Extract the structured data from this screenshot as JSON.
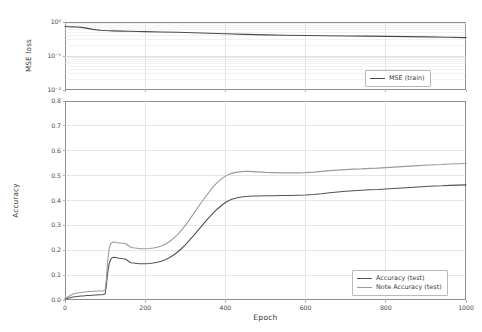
{
  "figure": {
    "background_color": "#ffffff",
    "axis_color": "#8d8d8d",
    "grid_color": "#d6d6d6"
  },
  "chart_data": [
    {
      "type": "line",
      "panel": "top",
      "title": "",
      "xlabel": "",
      "ylabel": "MSE loss",
      "yscale": "log",
      "ylim": [
        0.01,
        1.0
      ],
      "xlim": [
        0,
        1000
      ],
      "grid": true,
      "legend_position": "lower right",
      "ytick_labels": [
        "10⁰",
        "10⁻¹",
        "10⁻²"
      ],
      "ytick_values": [
        1.0,
        0.1,
        0.01
      ],
      "xtick_values": [
        0,
        200,
        400,
        600,
        800,
        1000
      ],
      "series": [
        {
          "name": "MSE (train)",
          "color": "#4a4a4a",
          "linewidth": 1.1,
          "x": [
            0,
            10,
            20,
            30,
            40,
            50,
            60,
            70,
            80,
            90,
            100,
            120,
            140,
            160,
            180,
            200,
            240,
            280,
            320,
            360,
            400,
            450,
            500,
            550,
            600,
            650,
            700,
            750,
            800,
            850,
            900,
            950,
            1000
          ],
          "y": [
            0.735,
            0.728,
            0.72,
            0.71,
            0.695,
            0.672,
            0.64,
            0.608,
            0.585,
            0.57,
            0.56,
            0.548,
            0.54,
            0.534,
            0.528,
            0.522,
            0.51,
            0.497,
            0.483,
            0.468,
            0.452,
            0.432,
            0.417,
            0.408,
            0.401,
            0.395,
            0.389,
            0.384,
            0.379,
            0.372,
            0.364,
            0.356,
            0.348
          ]
        }
      ]
    },
    {
      "type": "line",
      "panel": "bottom",
      "title": "",
      "xlabel": "Epoch",
      "ylabel": "Accuracy",
      "yscale": "linear",
      "ylim": [
        0.0,
        0.8
      ],
      "xlim": [
        0,
        1000
      ],
      "grid": true,
      "legend_position": "lower right",
      "ytick_labels": [
        "0.0",
        "0.1",
        "0.2",
        "0.3",
        "0.4",
        "0.5",
        "0.6",
        "0.7",
        "0.8"
      ],
      "ytick_values": [
        0.0,
        0.1,
        0.2,
        0.3,
        0.4,
        0.5,
        0.6,
        0.7,
        0.8
      ],
      "xtick_values": [
        0,
        200,
        400,
        600,
        800,
        1000
      ],
      "series": [
        {
          "name": "Accuracy (test)",
          "color": "#525252",
          "linewidth": 1.1,
          "x": [
            0,
            5,
            10,
            15,
            20,
            25,
            30,
            35,
            40,
            45,
            50,
            55,
            60,
            65,
            70,
            75,
            80,
            85,
            90,
            95,
            100,
            103,
            106,
            110,
            114,
            118,
            122,
            126,
            130,
            135,
            140,
            145,
            150,
            155,
            160,
            165,
            170,
            175,
            180,
            185,
            190,
            195,
            200,
            210,
            220,
            230,
            240,
            250,
            260,
            270,
            280,
            290,
            300,
            310,
            320,
            330,
            340,
            350,
            360,
            370,
            380,
            390,
            400,
            410,
            420,
            430,
            440,
            450,
            460,
            470,
            480,
            500,
            520,
            540,
            560,
            580,
            600,
            620,
            640,
            660,
            680,
            700,
            720,
            740,
            760,
            780,
            800,
            820,
            840,
            860,
            880,
            900,
            920,
            940,
            960,
            980,
            1000
          ],
          "y": [
            0.004,
            0.006,
            0.008,
            0.01,
            0.012,
            0.013,
            0.014,
            0.015,
            0.016,
            0.016,
            0.017,
            0.018,
            0.018,
            0.019,
            0.019,
            0.02,
            0.02,
            0.021,
            0.021,
            0.022,
            0.024,
            0.055,
            0.105,
            0.145,
            0.163,
            0.17,
            0.172,
            0.171,
            0.17,
            0.168,
            0.167,
            0.166,
            0.165,
            0.16,
            0.154,
            0.15,
            0.149,
            0.148,
            0.147,
            0.146,
            0.146,
            0.146,
            0.146,
            0.147,
            0.149,
            0.152,
            0.156,
            0.162,
            0.17,
            0.18,
            0.192,
            0.206,
            0.222,
            0.24,
            0.258,
            0.277,
            0.296,
            0.315,
            0.333,
            0.35,
            0.366,
            0.38,
            0.392,
            0.401,
            0.407,
            0.411,
            0.414,
            0.416,
            0.417,
            0.418,
            0.418,
            0.419,
            0.419,
            0.42,
            0.42,
            0.421,
            0.422,
            0.424,
            0.427,
            0.431,
            0.434,
            0.437,
            0.439,
            0.441,
            0.443,
            0.444,
            0.446,
            0.448,
            0.45,
            0.452,
            0.454,
            0.456,
            0.458,
            0.459,
            0.461,
            0.462,
            0.463
          ]
        },
        {
          "name": "Note Accuracy (test)",
          "color": "#9a9a9a",
          "linewidth": 1.1,
          "x": [
            0,
            5,
            10,
            15,
            20,
            25,
            30,
            35,
            40,
            45,
            50,
            55,
            60,
            65,
            70,
            75,
            80,
            85,
            90,
            95,
            100,
            103,
            106,
            110,
            114,
            118,
            122,
            126,
            130,
            135,
            140,
            145,
            150,
            155,
            160,
            165,
            170,
            175,
            180,
            185,
            190,
            195,
            200,
            210,
            220,
            230,
            240,
            250,
            260,
            270,
            280,
            290,
            300,
            310,
            320,
            330,
            340,
            350,
            360,
            370,
            380,
            390,
            400,
            410,
            420,
            430,
            440,
            450,
            460,
            470,
            480,
            500,
            520,
            540,
            560,
            580,
            600,
            620,
            640,
            660,
            680,
            700,
            720,
            740,
            760,
            780,
            800,
            820,
            840,
            860,
            880,
            900,
            920,
            940,
            960,
            980,
            1000
          ],
          "y": [
            0.006,
            0.01,
            0.015,
            0.02,
            0.024,
            0.026,
            0.028,
            0.029,
            0.03,
            0.031,
            0.032,
            0.033,
            0.034,
            0.034,
            0.035,
            0.035,
            0.036,
            0.036,
            0.036,
            0.037,
            0.04,
            0.08,
            0.15,
            0.205,
            0.226,
            0.232,
            0.233,
            0.232,
            0.23,
            0.229,
            0.228,
            0.228,
            0.227,
            0.222,
            0.216,
            0.212,
            0.21,
            0.209,
            0.208,
            0.207,
            0.206,
            0.206,
            0.206,
            0.207,
            0.209,
            0.212,
            0.217,
            0.224,
            0.234,
            0.247,
            0.262,
            0.28,
            0.3,
            0.322,
            0.345,
            0.369,
            0.392,
            0.414,
            0.436,
            0.456,
            0.473,
            0.487,
            0.498,
            0.506,
            0.511,
            0.514,
            0.516,
            0.517,
            0.517,
            0.516,
            0.515,
            0.513,
            0.512,
            0.511,
            0.511,
            0.511,
            0.512,
            0.514,
            0.517,
            0.52,
            0.522,
            0.524,
            0.526,
            0.527,
            0.529,
            0.53,
            0.532,
            0.534,
            0.536,
            0.538,
            0.54,
            0.542,
            0.544,
            0.545,
            0.547,
            0.548,
            0.549
          ]
        }
      ]
    }
  ],
  "top_legend": {
    "entries": [
      {
        "label": "MSE (train)",
        "color": "#4a4a4a"
      }
    ]
  },
  "bottom_legend": {
    "entries": [
      {
        "label": "Accuracy (test)",
        "color": "#525252"
      },
      {
        "label": "Note Accuracy (test)",
        "color": "#9a9a9a"
      }
    ]
  }
}
